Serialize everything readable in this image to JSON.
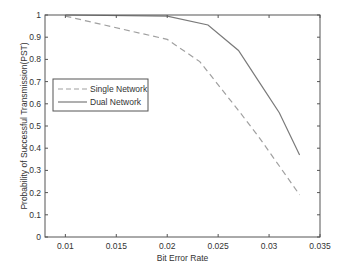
{
  "chart_data": {
    "type": "line",
    "title": "",
    "xlabel": "Bit Error Rate",
    "ylabel": "Probability of Successful Transmission(PST)",
    "xlim": [
      0.008,
      0.035
    ],
    "ylim": [
      0,
      1
    ],
    "xticks": [
      0.01,
      0.015,
      0.02,
      0.025,
      0.03,
      0.035
    ],
    "xtick_labels": [
      "0.01",
      "0.015",
      "0.02",
      "0.025",
      "0.03",
      "0.035"
    ],
    "yticks": [
      0,
      0.1,
      0.2,
      0.3,
      0.4,
      0.5,
      0.6,
      0.7,
      0.8,
      0.9,
      1
    ],
    "ytick_labels": [
      "0",
      "0.1",
      "0.2",
      "0.3",
      "0.4",
      "0.5",
      "0.6",
      "0.7",
      "0.8",
      "0.9",
      "1"
    ],
    "grid": false,
    "legend_position": "middle-left",
    "series": [
      {
        "name": "Single Network",
        "style": "dashed",
        "color": "#a0a0a0",
        "x": [
          0.01,
          0.02,
          0.0232,
          0.027,
          0.029,
          0.031,
          0.033
        ],
        "y": [
          0.995,
          0.89,
          0.79,
          0.57,
          0.45,
          0.32,
          0.19
        ]
      },
      {
        "name": "Dual Network",
        "style": "solid",
        "color": "#7a7a7a",
        "x": [
          0.01,
          0.02,
          0.024,
          0.027,
          0.029,
          0.031,
          0.033
        ],
        "y": [
          1.0,
          0.995,
          0.955,
          0.84,
          0.7,
          0.56,
          0.37
        ]
      }
    ]
  }
}
